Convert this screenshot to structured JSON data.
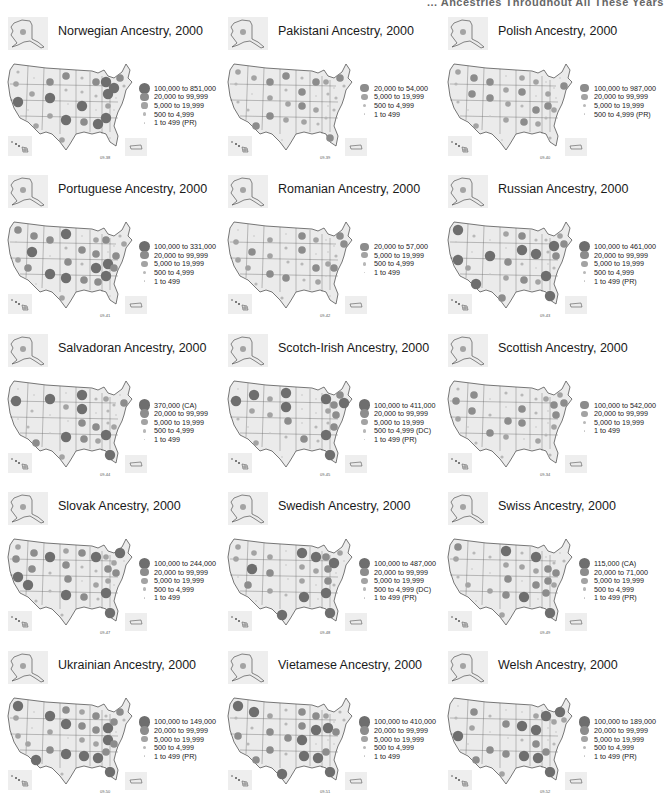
{
  "page": {
    "header_fragment": "... Ancestries Throughout All These Years"
  },
  "colors": {
    "state_fill": "#ebebeb",
    "state_stroke": "#555555",
    "inset_bg": "#eeeeee",
    "class1": "#6e6e6e",
    "class2": "#8c8c8c",
    "class3": "#a3a3a3",
    "class4": "#b8b8b8",
    "class5": "#c4c4c4"
  },
  "panels": [
    {
      "title": "Norwegian Ancestry, 2000",
      "figure": "09-38",
      "legend": [
        "100,000 to 851,000",
        "20,000 to 99,999",
        "5,000 to 19,999",
        "500 to 4,999",
        "1 to 499 (PR)"
      ]
    },
    {
      "title": "Pakistani Ancestry, 2000",
      "figure": "09-39",
      "legend": [
        "20,000 to 54,000",
        "5,000 to 19,999",
        "500 to 4,999",
        "1 to 499"
      ]
    },
    {
      "title": "Polish Ancestry, 2000",
      "figure": "09-40",
      "legend": [
        "100,000 to 987,000",
        "20,000 to 99,999",
        "5,000 to 19,999",
        "500 to 4,999 (PR)"
      ]
    },
    {
      "title": "Portuguese Ancestry, 2000",
      "figure": "09-41",
      "legend": [
        "100,000 to 331,000",
        "20,000 to 99,999",
        "5,000 to 19,999",
        "500 to 4,999",
        "1 to 499"
      ]
    },
    {
      "title": "Romanian Ancestry, 2000",
      "figure": "09-42",
      "legend": [
        "20,000 to 57,000",
        "5,000 to 19,999",
        "500 to 4,999",
        "1 to 499"
      ]
    },
    {
      "title": "Russian Ancestry, 2000",
      "figure": "09-43",
      "legend": [
        "100,000 to 461,000",
        "20,000 to 99,999",
        "5,000 to 19,999",
        "500 to 4,999",
        "1 to 499 (PR)"
      ]
    },
    {
      "title": "Salvadoran Ancestry, 2000",
      "figure": "09-44",
      "legend": [
        "370,000 (CA)",
        "20,000 to 99,999",
        "5,000 to 19,999",
        "500 to 4,999",
        "1 to 499"
      ]
    },
    {
      "title": "Scotch-Irish Ancestry, 2000",
      "figure": "09-45",
      "legend": [
        "100,000 to 411,000",
        "20,000 to 99,999",
        "5,000 to 19,999",
        "500 to 4,999 (DC)",
        "1 to 499 (PR)"
      ]
    },
    {
      "title": "Scottish Ancestry, 2000",
      "figure": "09-34",
      "legend": [
        "100,000 to 542,000",
        "20,000 to 99,999",
        "5,000 to 19,999",
        "1 to 499"
      ]
    },
    {
      "title": "Slovak Ancestry, 2000",
      "figure": "09-47",
      "legend": [
        "100,000 to 244,000",
        "20,000 to 99,999",
        "5,000 to 19,999",
        "500 to 4,999",
        "1 to 499"
      ]
    },
    {
      "title": "Swedish Ancestry, 2000",
      "figure": "09-48",
      "legend": [
        "100,000 to 487,000",
        "20,000 to 99,999",
        "5,000 to 19,999",
        "500 to 4,999 (DC)",
        "1 to 499 (PR)"
      ]
    },
    {
      "title": "Swiss Ancestry, 2000",
      "figure": "09-49",
      "legend": [
        "115,000 (CA)",
        "20,000 to 71,000",
        "5,000 to 19,999",
        "500 to 4,999",
        "1 to 499 (PR)"
      ]
    },
    {
      "title": "Ukrainian Ancestry, 2000",
      "figure": "09-50",
      "legend": [
        "100,000 to 149,000",
        "20,000 to 99,999",
        "5,000 to 19,999",
        "500 to 4,999",
        "1 to 499 (PR)"
      ]
    },
    {
      "title": "Vietamese Ancestry, 2000",
      "figure": "09-51",
      "legend": [
        "100,000 to 410,000",
        "20,000 to 99,999",
        "5,000 to 19,999",
        "500 to 4,999",
        "1 to 499"
      ]
    },
    {
      "title": "Welsh Ancestry, 2000",
      "figure": "09-52",
      "legend": [
        "100,000 to 189,000",
        "20,000 to 99,999",
        "5,000 to 19,999",
        "500 to 4,999",
        "1 to 499 (PR)"
      ]
    }
  ]
}
